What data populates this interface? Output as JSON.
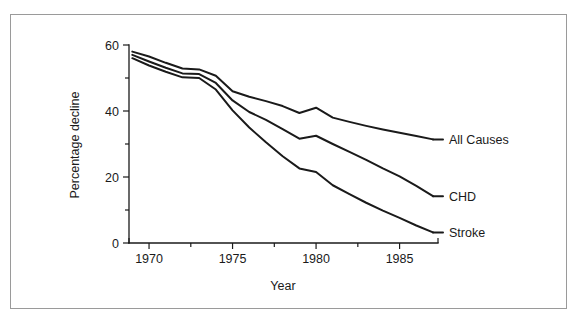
{
  "chart_data": {
    "type": "line",
    "title": "",
    "subtitle": "",
    "xlabel": "Year",
    "ylabel": "Percentage decline",
    "xlim": [
      1968.8,
      1987.3
    ],
    "ylim": [
      0,
      60
    ],
    "xticks": [
      1970,
      1975,
      1980,
      1985
    ],
    "xtick_labels": [
      "1970",
      "1975",
      "1980",
      "1985"
    ],
    "xminor_ticks": [
      1972.5,
      1977.5,
      1982.5
    ],
    "yticks": [
      0,
      20,
      40,
      60
    ],
    "ytick_labels": [
      "0",
      "20",
      "40",
      "60"
    ],
    "yminor_ticks": [
      10,
      30,
      50
    ],
    "grid": false,
    "legend_position": "right-inline-labels",
    "x": [
      1969,
      1970,
      1971,
      1972,
      1973,
      1974,
      1975,
      1976,
      1977,
      1978,
      1979,
      1980,
      1981,
      1982,
      1983,
      1984,
      1985,
      1986,
      1987
    ],
    "series": [
      {
        "name": "All Causes",
        "label": "All Causes",
        "color": "#1a1a1a",
        "values": [
          58.0,
          56.5,
          54.6,
          52.9,
          52.6,
          50.7,
          46.0,
          44.3,
          43.0,
          41.5,
          39.4,
          41.0,
          38.0,
          36.7,
          35.5,
          34.4,
          33.4,
          32.4,
          31.4
        ]
      },
      {
        "name": "CHD",
        "label": "CHD",
        "color": "#1a1a1a",
        "values": [
          57.0,
          55.0,
          53.1,
          51.4,
          51.2,
          48.5,
          43.2,
          39.7,
          37.3,
          34.5,
          31.6,
          32.5,
          30.0,
          27.6,
          25.2,
          22.6,
          20.2,
          17.3,
          14.2
        ]
      },
      {
        "name": "Stroke",
        "label": "Stroke",
        "color": "#1a1a1a",
        "values": [
          56.0,
          53.8,
          51.9,
          50.2,
          50.0,
          46.5,
          40.2,
          35.0,
          30.5,
          26.3,
          22.6,
          21.5,
          17.5,
          14.8,
          12.2,
          9.8,
          7.6,
          5.3,
          3.2
        ]
      }
    ]
  },
  "axis": {
    "x_title": "Year",
    "y_title": "Percentage decline"
  },
  "labels": {
    "all_causes": "All Causes",
    "chd": "CHD",
    "stroke": "Stroke"
  },
  "colors": {
    "line": "#1a1a1a",
    "frame": "#9a9a9a",
    "background": "#ffffff"
  }
}
